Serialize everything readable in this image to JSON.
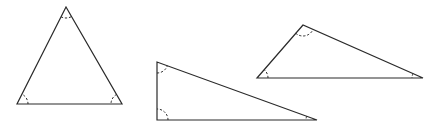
{
  "diagram": {
    "stroke_color": "#2a2a2a",
    "background": "#ffffff",
    "triangles": [
      {
        "name": "equilateral-like",
        "vertices": [
          [
            66,
            7
          ],
          [
            17,
            104
          ],
          [
            122,
            104
          ]
        ],
        "angle_marks": 3
      },
      {
        "name": "right-triangle",
        "vertices": [
          [
            157,
            62
          ],
          [
            157,
            120
          ],
          [
            317,
            120
          ]
        ],
        "angle_marks": 3
      },
      {
        "name": "obtuse-triangle",
        "vertices": [
          [
            303,
            25
          ],
          [
            257,
            78
          ],
          [
            423,
            78
          ]
        ],
        "angle_marks": 3
      }
    ]
  }
}
